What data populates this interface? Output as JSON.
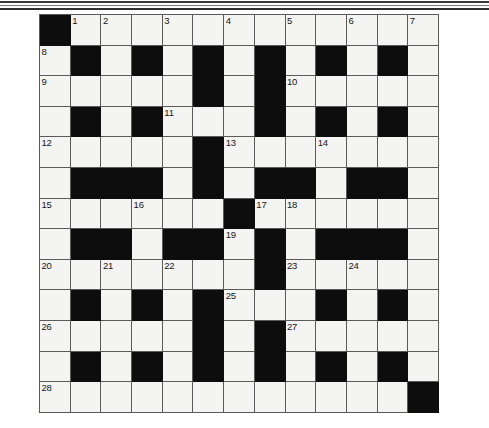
{
  "page": {
    "type": "crossword-puzzle-grid",
    "rows": 13,
    "columns": 13
  },
  "decor": {
    "top_rules": 3
  },
  "colors": {
    "block": "#0d0d0d",
    "empty_cell": "#f4f4f2",
    "grid_line": "#5a5a5a",
    "number_text": "#171717",
    "page_background": "#ffffff"
  },
  "grid": {
    "legend": {
      "W": "open-cell",
      "B": "blocked-cell"
    },
    "cells": [
      [
        "B",
        "W",
        "W",
        "W",
        "W",
        "W",
        "W",
        "W",
        "W",
        "W",
        "W",
        "W",
        "W"
      ],
      [
        "W",
        "B",
        "W",
        "B",
        "W",
        "B",
        "W",
        "B",
        "W",
        "B",
        "W",
        "B",
        "W"
      ],
      [
        "W",
        "W",
        "W",
        "W",
        "W",
        "B",
        "W",
        "B",
        "W",
        "W",
        "W",
        "W",
        "W"
      ],
      [
        "W",
        "B",
        "W",
        "B",
        "W",
        "W",
        "W",
        "B",
        "W",
        "B",
        "W",
        "B",
        "W"
      ],
      [
        "W",
        "W",
        "W",
        "W",
        "W",
        "B",
        "W",
        "W",
        "W",
        "W",
        "W",
        "W",
        "W"
      ],
      [
        "W",
        "B",
        "B",
        "B",
        "W",
        "B",
        "W",
        "B",
        "B",
        "W",
        "B",
        "B",
        "W"
      ],
      [
        "W",
        "W",
        "W",
        "W",
        "W",
        "W",
        "B",
        "W",
        "W",
        "W",
        "W",
        "W",
        "W"
      ],
      [
        "W",
        "B",
        "B",
        "W",
        "B",
        "B",
        "W",
        "B",
        "W",
        "B",
        "B",
        "B",
        "W"
      ],
      [
        "W",
        "W",
        "W",
        "W",
        "W",
        "W",
        "W",
        "B",
        "W",
        "W",
        "W",
        "W",
        "W"
      ],
      [
        "W",
        "B",
        "W",
        "B",
        "W",
        "B",
        "W",
        "W",
        "W",
        "B",
        "W",
        "B",
        "W"
      ],
      [
        "W",
        "W",
        "W",
        "W",
        "W",
        "B",
        "W",
        "B",
        "W",
        "W",
        "W",
        "W",
        "W"
      ],
      [
        "W",
        "B",
        "W",
        "B",
        "W",
        "B",
        "W",
        "B",
        "W",
        "B",
        "W",
        "B",
        "W"
      ],
      [
        "W",
        "W",
        "W",
        "W",
        "W",
        "W",
        "W",
        "W",
        "W",
        "W",
        "W",
        "W",
        "B"
      ]
    ],
    "numbers": [
      [
        null,
        "1",
        "2",
        null,
        "3",
        null,
        "4",
        null,
        "5",
        null,
        "6",
        null,
        "7"
      ],
      [
        "8",
        null,
        null,
        null,
        null,
        null,
        null,
        null,
        null,
        null,
        null,
        null,
        null
      ],
      [
        "9",
        null,
        null,
        null,
        null,
        null,
        null,
        null,
        "10",
        null,
        null,
        null,
        null
      ],
      [
        null,
        null,
        null,
        null,
        "11",
        null,
        null,
        null,
        null,
        null,
        null,
        null,
        null
      ],
      [
        "12",
        null,
        null,
        null,
        null,
        null,
        "13",
        null,
        null,
        "14",
        null,
        null,
        null
      ],
      [
        null,
        null,
        null,
        null,
        null,
        null,
        null,
        null,
        null,
        null,
        null,
        null,
        null
      ],
      [
        "15",
        null,
        null,
        "16",
        null,
        null,
        null,
        "17",
        "18",
        null,
        null,
        null,
        null
      ],
      [
        null,
        null,
        null,
        null,
        null,
        null,
        "19",
        null,
        null,
        null,
        null,
        null,
        null
      ],
      [
        "20",
        null,
        "21",
        null,
        "22",
        null,
        null,
        null,
        "23",
        null,
        "24",
        null,
        null
      ],
      [
        null,
        null,
        null,
        null,
        null,
        null,
        "25",
        null,
        null,
        null,
        null,
        null,
        null
      ],
      [
        "26",
        null,
        null,
        null,
        null,
        null,
        null,
        null,
        "27",
        null,
        null,
        null,
        null
      ],
      [
        null,
        null,
        null,
        null,
        null,
        null,
        null,
        null,
        null,
        null,
        null,
        null,
        null
      ],
      [
        "28",
        null,
        null,
        null,
        null,
        null,
        null,
        null,
        null,
        null,
        null,
        null,
        null
      ]
    ]
  }
}
